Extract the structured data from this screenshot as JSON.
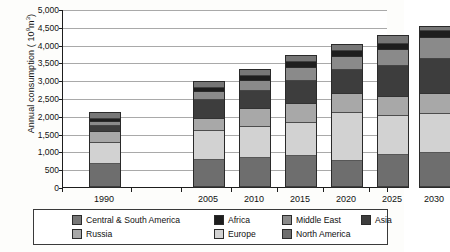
{
  "chart_data": {
    "type": "bar",
    "subtype": "stacked-vertical",
    "title": "",
    "xlabel": "",
    "ylabel": "Annual consumption ( 10⁹ m³)",
    "ylabel_prefix": "Annual consumption ( (10",
    "ylabel_sup": "9",
    "ylabel_suffix": "m",
    "ylabel_sup2": "3",
    "ylabel_end": ")",
    "ylim": [
      0,
      5000
    ],
    "ytick_step": 500,
    "grid": true,
    "legend_position": "bottom",
    "categories": [
      "1990",
      "2005",
      "2010",
      "2015",
      "2020",
      "2025",
      "2030"
    ],
    "ytick_labels": [
      "0",
      "500",
      "1,000",
      "1,500",
      "2,000",
      "2,500",
      "3,000",
      "3,500",
      "4,000",
      "4,500",
      "5,000"
    ],
    "ytick_values": [
      0,
      500,
      1000,
      1500,
      2000,
      2500,
      3000,
      3500,
      4000,
      4500,
      5000
    ],
    "stack_order_bottom_to_top": [
      "North America",
      "Europe",
      "Russia",
      "Asia",
      "Middle East",
      "Africa",
      "Central & South America"
    ],
    "series": [
      {
        "name": "North America",
        "color": "#6e6e6e",
        "values": [
          650,
          770,
          820,
          860,
          870,
          910,
          950
        ]
      },
      {
        "name": "Europe",
        "color": "#d2d2d2",
        "values": [
          580,
          810,
          880,
          940,
          1550,
          1090,
          1100
        ]
      },
      {
        "name": "Russia",
        "color": "#a8a8a8",
        "values": [
          330,
          330,
          490,
          520,
          630,
          530,
          550
        ]
      },
      {
        "name": "Asia",
        "color": "#3d3d3d",
        "values": [
          150,
          540,
          500,
          650,
          800,
          870,
          1000
        ]
      },
      {
        "name": "Middle East",
        "color": "#8a8a8a",
        "values": [
          110,
          220,
          290,
          370,
          420,
          450,
          590
        ]
      },
      {
        "name": "Africa",
        "color": "#1e1e1e",
        "values": [
          90,
          110,
          140,
          180,
          200,
          180,
          190
        ]
      },
      {
        "name": "Central & South America",
        "color": "#767676",
        "values": [
          170,
          170,
          160,
          160,
          210,
          200,
          120
        ]
      }
    ],
    "totals": [
      2080,
      2950,
      3280,
      3680,
      4000,
      4230,
      4500
    ]
  },
  "legend": {
    "row1": [
      {
        "label": "Central & South America",
        "color": "#767676"
      },
      {
        "label": "Africa",
        "color": "#1e1e1e"
      },
      {
        "label": "Middle East",
        "color": "#8a8a8a"
      },
      {
        "label": "Asia",
        "color": "#3d3d3d"
      }
    ],
    "row2": [
      {
        "label": "Russia",
        "color": "#a8a8a8"
      },
      {
        "label": "Europe",
        "color": "#d2d2d2"
      },
      {
        "label": "North America",
        "color": "#6e6e6e"
      }
    ]
  }
}
